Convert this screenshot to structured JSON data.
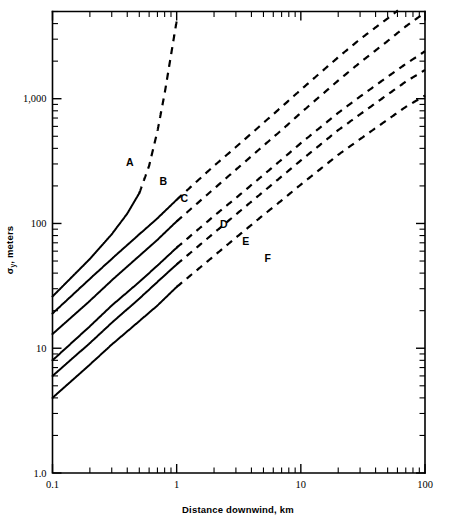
{
  "figure": {
    "name": "pasquill-gifford-sigma-y-chart",
    "background_color": "#ffffff",
    "ink_color": "#000000"
  },
  "axes": {
    "x": {
      "title": "Distance downwind, km",
      "scale": "log",
      "min": 0.1,
      "max": 100,
      "tick_labels": [
        "0.1",
        "1",
        "10",
        "100"
      ],
      "tick_values": [
        0.1,
        1,
        10,
        100
      ],
      "minor_ticks": [
        0.2,
        0.3,
        0.4,
        0.5,
        0.6,
        0.7,
        0.8,
        0.9,
        2,
        3,
        4,
        5,
        6,
        7,
        8,
        9,
        20,
        30,
        40,
        50,
        60,
        70,
        80,
        90
      ],
      "grid": false
    },
    "y": {
      "title_symbol": "σ",
      "title_subscript": "y",
      "title_rest": ", meters",
      "title": "σy, meters",
      "scale": "log",
      "min": 1.0,
      "max": 5000,
      "tick_labels": [
        "1.0",
        "10",
        "100",
        "1,000"
      ],
      "tick_values": [
        1.0,
        10,
        100,
        1000
      ],
      "minor_ticks": [
        2,
        3,
        4,
        5,
        6,
        7,
        8,
        9,
        20,
        30,
        40,
        50,
        60,
        70,
        80,
        90,
        200,
        300,
        400,
        500,
        600,
        700,
        800,
        900,
        2000,
        3000,
        4000,
        5000
      ],
      "grid": false
    }
  },
  "chart_data": {
    "type": "line",
    "title": "",
    "subtitle": "",
    "xlabel": "Distance downwind, km",
    "ylabel": "σy, meters",
    "xscale": "log",
    "yscale": "log",
    "xlim": [
      0.1,
      100
    ],
    "ylim": [
      1.0,
      5000
    ],
    "grid": false,
    "legend": "inline-curve-labels",
    "legend_position": "inline",
    "annotations": [
      {
        "label": "A",
        "x": 0.42,
        "y": 290
      },
      {
        "label": "B",
        "x": 0.78,
        "y": 205
      },
      {
        "label": "C",
        "x": 1.15,
        "y": 150
      },
      {
        "label": "D",
        "x": 2.4,
        "y": 92
      },
      {
        "label": "E",
        "x": 3.6,
        "y": 67
      },
      {
        "label": "F",
        "x": 5.4,
        "y": 49
      }
    ],
    "series": [
      {
        "name": "A",
        "stability_class": "A - Very unstable",
        "solid_to_x": 0.5,
        "x": [
          0.1,
          0.15,
          0.2,
          0.3,
          0.4,
          0.5,
          0.6,
          0.7,
          0.8,
          1.0
        ],
        "values": [
          26,
          39,
          52,
          82,
          120,
          175,
          290,
          550,
          1100,
          4200
        ]
      },
      {
        "name": "B",
        "stability_class": "B - Moderately unstable",
        "solid_to_x": 1.0,
        "x": [
          0.1,
          0.2,
          0.3,
          0.5,
          0.7,
          1.0,
          2,
          3,
          5,
          7,
          10,
          20,
          30,
          50,
          70,
          100
        ],
        "values": [
          19,
          36,
          52,
          82,
          110,
          155,
          290,
          410,
          640,
          860,
          1180,
          2150,
          3000,
          4400,
          5700,
          7400
        ]
      },
      {
        "name": "C",
        "stability_class": "C - Slightly unstable",
        "solid_to_x": 1.0,
        "x": [
          0.1,
          0.2,
          0.3,
          0.5,
          0.7,
          1.0,
          2,
          3,
          5,
          7,
          10,
          20,
          30,
          50,
          70,
          100
        ],
        "values": [
          13,
          24,
          35,
          55,
          74,
          104,
          190,
          270,
          420,
          560,
          770,
          1400,
          1950,
          2900,
          3800,
          4900
        ]
      },
      {
        "name": "D",
        "stability_class": "D - Neutral",
        "solid_to_x": 1.0,
        "x": [
          0.1,
          0.2,
          0.3,
          0.5,
          0.7,
          1.0,
          2,
          3,
          5,
          7,
          10,
          20,
          30,
          50,
          70,
          100
        ],
        "values": [
          8.0,
          15,
          22,
          34,
          46,
          64,
          115,
          160,
          245,
          325,
          440,
          770,
          1040,
          1500,
          1900,
          2400
        ]
      },
      {
        "name": "E",
        "stability_class": "E - Slightly stable",
        "solid_to_x": 1.0,
        "x": [
          0.1,
          0.2,
          0.3,
          0.5,
          0.7,
          1.0,
          2,
          3,
          5,
          7,
          10,
          20,
          30,
          50,
          70,
          100
        ],
        "values": [
          6.0,
          11,
          16,
          25,
          34,
          47,
          84,
          118,
          180,
          238,
          320,
          560,
          750,
          1080,
          1370,
          1700
        ]
      },
      {
        "name": "F",
        "stability_class": "F - Moderately stable",
        "solid_to_x": 1.0,
        "x": [
          0.1,
          0.2,
          0.3,
          0.5,
          0.7,
          1.0,
          2,
          3,
          5,
          7,
          10,
          20,
          30,
          50,
          70,
          100
        ],
        "values": [
          4.0,
          7.4,
          10.7,
          16.5,
          22,
          31,
          55,
          77,
          117,
          153,
          205,
          355,
          475,
          680,
          860,
          1060
        ]
      }
    ]
  }
}
